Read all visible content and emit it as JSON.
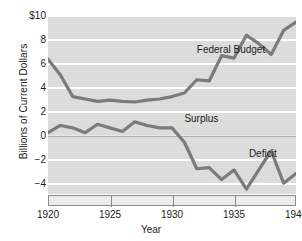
{
  "chart_data": {
    "type": "line",
    "title": "",
    "xlabel": "Year",
    "ylabel": "Billions of Current Dollars",
    "xlim": [
      1920,
      1940
    ],
    "ylim": [
      -4.8,
      10
    ],
    "xticks": [
      1920,
      1925,
      1930,
      1935,
      1940
    ],
    "xtick_labels": [
      "1920",
      "1925",
      "1930",
      "1935",
      "1940"
    ],
    "yticks": [
      10,
      8,
      6,
      4,
      2,
      0,
      -2,
      -4
    ],
    "ytick_labels": [
      "$10",
      "8",
      "6",
      "4",
      "2",
      "0",
      "−2",
      "−4"
    ],
    "grid": "horizontal white bands on gray panel",
    "legend": "inline annotations",
    "zero_line": 0,
    "line_color": "#7b7b7b",
    "panel_color": "#dcdcdc",
    "gridline_color": "#ffffff",
    "axis_color": "#8c8c8c",
    "annotations": [
      {
        "text": "Federal Budget",
        "x": 1932,
        "y": 7.2
      },
      {
        "text": "Surplus",
        "x": 1931,
        "y": 1.4
      },
      {
        "text": "Deficit",
        "x": 1936.2,
        "y": -1.5
      }
    ],
    "x": [
      1920,
      1921,
      1922,
      1923,
      1924,
      1925,
      1926,
      1927,
      1928,
      1929,
      1930,
      1931,
      1932,
      1933,
      1934,
      1935,
      1936,
      1937,
      1938,
      1939,
      1940
    ],
    "series": [
      {
        "name": "Federal Budget",
        "values": [
          6.4,
          5.1,
          3.3,
          3.1,
          2.9,
          3.0,
          2.9,
          2.85,
          3.0,
          3.1,
          3.3,
          3.6,
          4.7,
          4.6,
          6.7,
          6.5,
          8.4,
          7.7,
          6.8,
          8.8,
          9.5
        ]
      },
      {
        "name": "Surplus / Deficit",
        "values": [
          0.3,
          0.9,
          0.7,
          0.3,
          1.0,
          0.7,
          0.4,
          1.2,
          0.9,
          0.7,
          0.7,
          -0.5,
          -2.7,
          -2.6,
          -3.6,
          -2.8,
          -4.4,
          -2.8,
          -1.2,
          -3.9,
          -3.1
        ]
      }
    ]
  },
  "axes": {
    "y_title": "Billions of Current Dollars",
    "x_title": "Year"
  }
}
